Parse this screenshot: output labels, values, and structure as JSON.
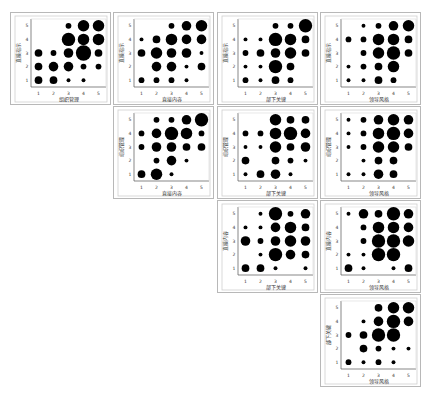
{
  "chart_data": {
    "type": "scatter",
    "subtype": "bubble-scatter-matrix",
    "title": "",
    "axis_ticks": [
      1,
      2,
      3,
      4,
      5
    ],
    "axis_range": [
      0.5,
      5.5
    ],
    "grid": false,
    "legend": null,
    "panels": [
      {
        "row": 0,
        "col": 0,
        "xlabel": "组织管理",
        "ylabel": "直接指示",
        "points": [
          [
            1,
            1,
            3
          ],
          [
            2,
            1,
            3
          ],
          [
            3,
            1,
            1
          ],
          [
            4,
            1,
            1
          ],
          [
            1,
            2,
            3
          ],
          [
            2,
            2,
            4
          ],
          [
            3,
            2,
            4
          ],
          [
            4,
            2,
            2
          ],
          [
            5,
            2,
            2
          ],
          [
            1,
            3,
            3
          ],
          [
            2,
            3,
            2
          ],
          [
            3,
            3,
            4
          ],
          [
            4,
            3,
            7
          ],
          [
            5,
            3,
            3
          ],
          [
            3,
            4,
            6
          ],
          [
            4,
            4,
            5
          ],
          [
            5,
            4,
            5
          ],
          [
            3,
            5,
            2
          ],
          [
            4,
            5,
            5
          ],
          [
            5,
            5,
            5
          ]
        ]
      },
      {
        "row": 0,
        "col": 1,
        "xlabel": "直接内容",
        "ylabel": "直接指示",
        "points": [
          [
            1,
            1,
            2
          ],
          [
            2,
            1,
            2
          ],
          [
            3,
            1,
            2
          ],
          [
            4,
            1,
            1
          ],
          [
            2,
            2,
            4
          ],
          [
            3,
            2,
            4
          ],
          [
            4,
            2,
            1
          ],
          [
            5,
            2,
            3
          ],
          [
            1,
            3,
            3
          ],
          [
            2,
            3,
            5
          ],
          [
            3,
            3,
            4
          ],
          [
            4,
            3,
            4
          ],
          [
            5,
            3,
            1
          ],
          [
            1,
            4,
            1
          ],
          [
            2,
            4,
            3
          ],
          [
            3,
            4,
            5
          ],
          [
            4,
            4,
            4
          ],
          [
            5,
            4,
            4
          ],
          [
            3,
            5,
            2
          ],
          [
            4,
            5,
            4
          ],
          [
            5,
            5,
            5
          ]
        ]
      },
      {
        "row": 0,
        "col": 2,
        "xlabel": "部下关键",
        "ylabel": "直接指示",
        "points": [
          [
            1,
            1,
            2
          ],
          [
            2,
            1,
            1
          ],
          [
            3,
            1,
            3
          ],
          [
            4,
            1,
            2
          ],
          [
            1,
            2,
            1
          ],
          [
            2,
            2,
            1
          ],
          [
            3,
            2,
            6
          ],
          [
            4,
            2,
            3
          ],
          [
            1,
            3,
            2
          ],
          [
            2,
            3,
            3
          ],
          [
            3,
            3,
            4
          ],
          [
            4,
            3,
            5
          ],
          [
            5,
            3,
            3
          ],
          [
            1,
            4,
            1
          ],
          [
            2,
            4,
            1
          ],
          [
            3,
            4,
            6
          ],
          [
            4,
            4,
            5
          ],
          [
            5,
            4,
            3
          ],
          [
            3,
            5,
            2
          ],
          [
            4,
            5,
            2
          ],
          [
            5,
            5,
            6
          ]
        ]
      },
      {
        "row": 0,
        "col": 3,
        "xlabel": "领导风格",
        "ylabel": "直接指示",
        "points": [
          [
            1,
            1,
            1
          ],
          [
            2,
            1,
            1
          ],
          [
            3,
            1,
            3
          ],
          [
            4,
            1,
            2
          ],
          [
            1,
            2,
            1
          ],
          [
            2,
            2,
            2
          ],
          [
            3,
            2,
            3
          ],
          [
            4,
            2,
            5
          ],
          [
            2,
            3,
            2
          ],
          [
            3,
            3,
            5
          ],
          [
            4,
            3,
            6
          ],
          [
            5,
            3,
            3
          ],
          [
            1,
            4,
            2
          ],
          [
            2,
            4,
            2
          ],
          [
            3,
            4,
            5
          ],
          [
            4,
            4,
            5
          ],
          [
            5,
            4,
            3
          ],
          [
            2,
            5,
            1
          ],
          [
            3,
            5,
            2
          ],
          [
            4,
            5,
            4
          ],
          [
            5,
            5,
            5
          ]
        ]
      },
      {
        "row": 1,
        "col": 1,
        "xlabel": "直接内容",
        "ylabel": "组织管理",
        "points": [
          [
            1,
            1,
            3
          ],
          [
            2,
            1,
            5
          ],
          [
            3,
            1,
            1
          ],
          [
            2,
            2,
            2
          ],
          [
            3,
            2,
            4
          ],
          [
            4,
            2,
            1
          ],
          [
            1,
            3,
            2
          ],
          [
            2,
            3,
            4
          ],
          [
            3,
            3,
            4
          ],
          [
            4,
            3,
            3
          ],
          [
            5,
            3,
            3
          ],
          [
            1,
            4,
            2
          ],
          [
            2,
            4,
            4
          ],
          [
            3,
            4,
            6
          ],
          [
            4,
            4,
            5
          ],
          [
            5,
            4,
            2
          ],
          [
            2,
            5,
            2
          ],
          [
            3,
            5,
            2
          ],
          [
            4,
            5,
            4
          ],
          [
            5,
            5,
            6
          ]
        ]
      },
      {
        "row": 1,
        "col": 2,
        "xlabel": "部下关键",
        "ylabel": "组织管理",
        "points": [
          [
            1,
            1,
            1
          ],
          [
            2,
            1,
            3
          ],
          [
            3,
            1,
            4
          ],
          [
            4,
            1,
            1
          ],
          [
            1,
            2,
            3
          ],
          [
            3,
            2,
            3
          ],
          [
            4,
            2,
            2
          ],
          [
            5,
            2,
            1
          ],
          [
            1,
            3,
            1
          ],
          [
            2,
            3,
            1
          ],
          [
            3,
            3,
            5
          ],
          [
            4,
            3,
            3
          ],
          [
            5,
            3,
            4
          ],
          [
            1,
            4,
            2
          ],
          [
            2,
            4,
            2
          ],
          [
            3,
            4,
            5
          ],
          [
            4,
            4,
            6
          ],
          [
            5,
            4,
            4
          ],
          [
            3,
            5,
            5
          ],
          [
            4,
            5,
            3
          ],
          [
            5,
            5,
            3
          ]
        ]
      },
      {
        "row": 1,
        "col": 3,
        "xlabel": "领导风格",
        "ylabel": "组织管理",
        "points": [
          [
            1,
            1,
            1
          ],
          [
            2,
            1,
            1
          ],
          [
            3,
            1,
            4
          ],
          [
            4,
            1,
            3
          ],
          [
            2,
            2,
            1
          ],
          [
            3,
            2,
            3
          ],
          [
            4,
            2,
            3
          ],
          [
            1,
            3,
            1
          ],
          [
            2,
            3,
            2
          ],
          [
            3,
            3,
            5
          ],
          [
            4,
            3,
            5
          ],
          [
            5,
            3,
            3
          ],
          [
            1,
            4,
            1
          ],
          [
            2,
            4,
            2
          ],
          [
            3,
            4,
            5
          ],
          [
            4,
            4,
            6
          ],
          [
            5,
            4,
            4
          ],
          [
            1,
            5,
            1
          ],
          [
            2,
            5,
            2
          ],
          [
            3,
            5,
            4
          ],
          [
            4,
            5,
            5
          ],
          [
            5,
            5,
            4
          ]
        ]
      },
      {
        "row": 2,
        "col": 2,
        "xlabel": "部下关键",
        "ylabel": "直接内容",
        "points": [
          [
            1,
            1,
            3
          ],
          [
            2,
            1,
            3
          ],
          [
            3,
            1,
            1
          ],
          [
            5,
            1,
            1
          ],
          [
            2,
            2,
            1
          ],
          [
            3,
            2,
            6
          ],
          [
            4,
            2,
            4
          ],
          [
            5,
            2,
            3
          ],
          [
            1,
            3,
            4
          ],
          [
            2,
            3,
            2
          ],
          [
            3,
            3,
            4
          ],
          [
            4,
            3,
            5
          ],
          [
            5,
            3,
            4
          ],
          [
            1,
            4,
            1
          ],
          [
            2,
            4,
            1
          ],
          [
            3,
            4,
            4
          ],
          [
            4,
            4,
            5
          ],
          [
            5,
            4,
            3
          ],
          [
            2,
            5,
            1
          ],
          [
            3,
            5,
            6
          ],
          [
            4,
            5,
            2
          ],
          [
            5,
            5,
            4
          ]
        ]
      },
      {
        "row": 2,
        "col": 3,
        "xlabel": "领导风格",
        "ylabel": "直接内容",
        "points": [
          [
            1,
            1,
            3
          ],
          [
            2,
            1,
            1
          ],
          [
            4,
            1,
            1
          ],
          [
            5,
            1,
            3
          ],
          [
            1,
            2,
            1
          ],
          [
            2,
            2,
            1
          ],
          [
            3,
            2,
            6
          ],
          [
            4,
            2,
            6
          ],
          [
            2,
            3,
            2
          ],
          [
            3,
            3,
            6
          ],
          [
            4,
            3,
            6
          ],
          [
            5,
            3,
            5
          ],
          [
            2,
            4,
            2
          ],
          [
            3,
            4,
            5
          ],
          [
            4,
            4,
            5
          ],
          [
            5,
            4,
            4
          ],
          [
            1,
            5,
            1
          ],
          [
            2,
            5,
            4
          ],
          [
            3,
            5,
            3
          ],
          [
            4,
            5,
            6
          ],
          [
            5,
            5,
            4
          ]
        ]
      },
      {
        "row": 3,
        "col": 3,
        "xlabel": "领导风格",
        "ylabel": "部下关键",
        "points": [
          [
            1,
            1,
            2
          ],
          [
            2,
            1,
            1
          ],
          [
            3,
            1,
            2
          ],
          [
            4,
            1,
            1
          ],
          [
            2,
            2,
            3
          ],
          [
            3,
            2,
            2
          ],
          [
            4,
            2,
            1
          ],
          [
            5,
            2,
            1
          ],
          [
            1,
            3,
            2
          ],
          [
            2,
            3,
            3
          ],
          [
            3,
            3,
            6
          ],
          [
            4,
            3,
            6
          ],
          [
            2,
            4,
            1
          ],
          [
            3,
            4,
            4
          ],
          [
            4,
            4,
            6
          ],
          [
            5,
            4,
            4
          ],
          [
            3,
            5,
            3
          ],
          [
            4,
            5,
            5
          ],
          [
            5,
            5,
            5
          ]
        ]
      }
    ],
    "note": "points are [x, y, relative_size 1-7] where size reflects frequency count"
  },
  "layout": {
    "col_x": [
      10,
      113,
      217,
      320
    ],
    "row_y": [
      12,
      106,
      200,
      294
    ]
  },
  "colors": {
    "marker": "#000000",
    "frame": "#b8b8b8",
    "axis": "#555555",
    "text": "#333333"
  }
}
